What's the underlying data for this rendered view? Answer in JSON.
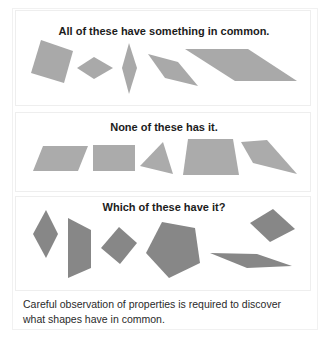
{
  "panels": [
    {
      "title": "All of these have something in common.",
      "fill": "#a9a9a9",
      "shapes": [
        {
          "name": "tilted-square",
          "points": "41,40 73,51 64,83 31,73"
        },
        {
          "name": "flat-rhombus",
          "points": "77,68 94,57 113,68 94,79"
        },
        {
          "name": "tall-rhombus",
          "points": "129,43 137,68 129,94 122,68"
        },
        {
          "name": "slanted-rhombus",
          "points": "148,54 178,62 198,86 165,78"
        },
        {
          "name": "long-parallelogram",
          "points": "185,49 248,49 297,81 235,81"
        }
      ]
    },
    {
      "title": "None of these has it.",
      "fill": "#ababab",
      "shapes": [
        {
          "name": "parallelogram",
          "points": "43,146 88,146 78,171 33,171"
        },
        {
          "name": "rectangle",
          "points": "93,145 135,145 135,171 93,171"
        },
        {
          "name": "triangle",
          "points": "163,142 173,174 140,166"
        },
        {
          "name": "trapezoid",
          "points": "188,139 233,139 239,175 183,175"
        },
        {
          "name": "irregular-quadrilateral",
          "points": "241,142 267,140 297,174 253,163"
        }
      ]
    },
    {
      "title": "Which of these have it?",
      "fill": "#878787",
      "shapes": [
        {
          "name": "rhombus",
          "points": "46,210 58,234 46,258 33,234"
        },
        {
          "name": "trapezoid",
          "points": "68,218 91,230 91,268 68,278"
        },
        {
          "name": "tilted-square",
          "points": "119,227 137,243 120,264 101,248"
        },
        {
          "name": "pentagon",
          "points": "162,222 195,228 200,263 169,278 146,253"
        },
        {
          "name": "thin-parallelogram",
          "points": "210,253 257,254 292,266 247,268"
        },
        {
          "name": "tilted-rhombus",
          "points": "273,209 295,229 270,242 250,223"
        }
      ]
    }
  ],
  "caption": {
    "line1": "Careful observation of properties is required to discover",
    "line2": "what shapes have in common."
  }
}
